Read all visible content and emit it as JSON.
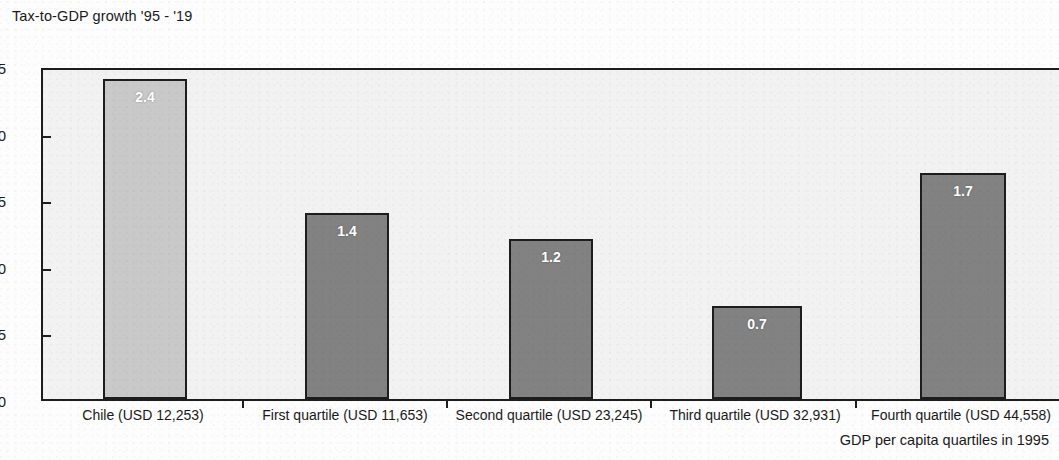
{
  "chart_data": {
    "type": "bar",
    "title": "Tax-to-GDP growth '95 - '19",
    "xlabel": "GDP per capita quartiles in 1995",
    "ylabel": "",
    "categories": [
      "Chile (USD 12,253)",
      "First quartile (USD 11,653)",
      "Second quartile (USD 23,245)",
      "Third quartile (USD 32,931)",
      "Fourth quartile (USD 44,558)"
    ],
    "values": [
      2.4,
      1.4,
      1.2,
      0.7,
      1.7
    ],
    "value_labels": [
      "2.4",
      "1.4",
      "1.2",
      "0.7",
      "1.7"
    ],
    "bar_colors": [
      "#c9c9c9",
      "#828282",
      "#828282",
      "#828282",
      "#828282"
    ],
    "ylim": [
      0.0,
      2.5
    ],
    "y_ticks": [
      0.0,
      0.5,
      1.0,
      1.5,
      2.0,
      2.5
    ],
    "y_tick_labels": [
      "0.0",
      "0.5",
      "1.0",
      "1.5",
      "2.0",
      "2.5"
    ],
    "grid": false,
    "legend": "none",
    "plot_background": "#f2f2f2",
    "axis_color": "#1d1d1d",
    "value_label_color": "#ffffff"
  }
}
